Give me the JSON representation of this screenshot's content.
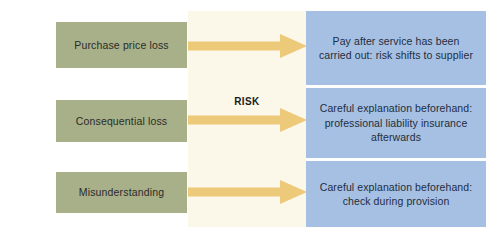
{
  "diagram": {
    "risk_label": "RISK",
    "colors": {
      "cause_box": "#a8b089",
      "measure_box": "#a6c0e3",
      "band": "#fbf7e9",
      "arrow": "#edc97a",
      "arrow_edge": "#e3bb63",
      "background": "#ffffff",
      "cause_text": "#2b2b28",
      "measure_text": "#1f2d3d",
      "risk_text": "#1d1d1b"
    },
    "causes": [
      {
        "id": "purchase-price-loss",
        "label": "Purchase price loss"
      },
      {
        "id": "consequential-loss",
        "label": "Consequential loss"
      },
      {
        "id": "misunderstanding",
        "label": "Misunderstanding"
      }
    ],
    "measures": [
      {
        "id": "pay-after-service",
        "label": "Pay after service has been carried out: risk shifts to supplier"
      },
      {
        "id": "careful-explanation-liability",
        "label": "Careful explanation beforehand: professional liability insurance afterwards"
      },
      {
        "id": "careful-explanation-check",
        "label": "Careful explanation beforehand: check during provision"
      }
    ],
    "arrows": [
      {
        "id": "arrow-purchase-price-loss",
        "name": "risk-arrow-1"
      },
      {
        "id": "arrow-consequential-loss",
        "name": "risk-arrow-2"
      },
      {
        "id": "arrow-misunderstanding",
        "name": "risk-arrow-3"
      }
    ]
  }
}
